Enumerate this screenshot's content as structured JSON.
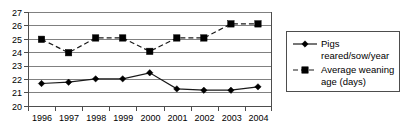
{
  "chart_data": {
    "type": "line",
    "title": "",
    "xlabel": "",
    "ylabel": "",
    "categories": [
      "1996",
      "1997",
      "1998",
      "1999",
      "2000",
      "2001",
      "2002",
      "2003",
      "2004"
    ],
    "ylim": [
      20,
      27
    ],
    "ytick_step": 1,
    "yticks": [
      "20",
      "21",
      "22",
      "23",
      "24",
      "25",
      "26",
      "27"
    ],
    "grid": true,
    "legend_position": "right",
    "series": [
      {
        "name": "Pigs reared/sow/year",
        "legend_line1": "Pigs",
        "legend_line2": "reared/sow/year",
        "marker": "diamond",
        "linestyle": "solid",
        "color": "#000000",
        "values": [
          21.7,
          21.8,
          22.05,
          22.05,
          22.5,
          21.3,
          21.2,
          21.2,
          21.45
        ]
      },
      {
        "name": "Average weaning age (days)",
        "legend_line1": "Average weaning",
        "legend_line2": "age (days)",
        "marker": "square",
        "linestyle": "dashed",
        "color": "#000000",
        "values": [
          25.0,
          24.0,
          25.1,
          25.1,
          24.1,
          25.1,
          25.1,
          26.15,
          26.15
        ]
      }
    ]
  },
  "axis": {
    "y_tick_labels": [
      "27",
      "26",
      "25",
      "24",
      "23",
      "22",
      "21",
      "20"
    ],
    "x_tick_labels": [
      "1996",
      "1997",
      "1998",
      "1999",
      "2000",
      "2001",
      "2002",
      "2003",
      "2004"
    ]
  },
  "legend": {
    "entries": [
      {
        "line1": "Pigs",
        "line2": "reared/sow/year"
      },
      {
        "line1": "Average weaning",
        "line2": "age (days)"
      }
    ]
  }
}
